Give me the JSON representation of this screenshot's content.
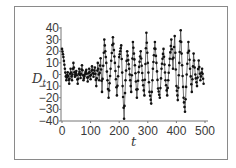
{
  "chart_data": {
    "type": "line",
    "title": "",
    "xlabel": "t",
    "ylabel": "D_t",
    "xlim": [
      0,
      500
    ],
    "ylim": [
      -40,
      40
    ],
    "xticks": [
      0,
      100,
      200,
      300,
      400,
      500
    ],
    "yticks": [
      40,
      30,
      20,
      10,
      0,
      -10,
      -20,
      -30,
      -40
    ],
    "grid": false,
    "legend": null,
    "marker": "filled-circle",
    "line_color": "#333333",
    "marker_color": "#111111",
    "keypoints": [
      [
        0,
        22
      ],
      [
        5,
        15
      ],
      [
        10,
        5
      ],
      [
        15,
        -5
      ],
      [
        20,
        2
      ],
      [
        25,
        -8
      ],
      [
        30,
        5
      ],
      [
        35,
        -5
      ],
      [
        40,
        10
      ],
      [
        45,
        -2
      ],
      [
        50,
        3
      ],
      [
        55,
        -8
      ],
      [
        60,
        5
      ],
      [
        65,
        -3
      ],
      [
        70,
        8
      ],
      [
        75,
        -5
      ],
      [
        80,
        0
      ],
      [
        85,
        4
      ],
      [
        90,
        -6
      ],
      [
        95,
        5
      ],
      [
        100,
        -4
      ],
      [
        105,
        7
      ],
      [
        110,
        -2
      ],
      [
        115,
        6
      ],
      [
        120,
        -10
      ],
      [
        125,
        10
      ],
      [
        130,
        -5
      ],
      [
        135,
        14
      ],
      [
        140,
        -15
      ],
      [
        148,
        30
      ],
      [
        155,
        10
      ],
      [
        163,
        -20
      ],
      [
        170,
        5
      ],
      [
        178,
        32
      ],
      [
        185,
        10
      ],
      [
        192,
        -18
      ],
      [
        200,
        15
      ],
      [
        207,
        25
      ],
      [
        212,
        -10
      ],
      [
        217,
        -38
      ],
      [
        222,
        -5
      ],
      [
        228,
        20
      ],
      [
        235,
        5
      ],
      [
        242,
        -15
      ],
      [
        248,
        28
      ],
      [
        255,
        8
      ],
      [
        262,
        -20
      ],
      [
        268,
        2
      ],
      [
        275,
        20
      ],
      [
        282,
        -5
      ],
      [
        288,
        -18
      ],
      [
        295,
        36
      ],
      [
        300,
        10
      ],
      [
        306,
        -15
      ],
      [
        312,
        -25
      ],
      [
        318,
        5
      ],
      [
        325,
        28
      ],
      [
        330,
        10
      ],
      [
        336,
        -12
      ],
      [
        342,
        -20
      ],
      [
        348,
        5
      ],
      [
        355,
        22
      ],
      [
        362,
        -5
      ],
      [
        368,
        -18
      ],
      [
        375,
        8
      ],
      [
        382,
        30
      ],
      [
        388,
        5
      ],
      [
        394,
        33
      ],
      [
        400,
        -10
      ],
      [
        405,
        -22
      ],
      [
        410,
        10
      ],
      [
        415,
        38
      ],
      [
        420,
        8
      ],
      [
        425,
        -20
      ],
      [
        430,
        -32
      ],
      [
        436,
        0
      ],
      [
        442,
        28
      ],
      [
        448,
        5
      ],
      [
        454,
        -15
      ],
      [
        460,
        18
      ],
      [
        466,
        0
      ],
      [
        472,
        -10
      ],
      [
        478,
        12
      ],
      [
        484,
        -5
      ],
      [
        490,
        5
      ],
      [
        495,
        -8
      ]
    ]
  },
  "axes": {
    "y_tick_labels": [
      "40",
      "30",
      "20",
      "10",
      "0",
      "−10",
      "−20",
      "−30",
      "−40"
    ],
    "x_tick_labels": [
      "0",
      "100",
      "200",
      "300",
      "400",
      "500"
    ],
    "ylabel_main": "D",
    "ylabel_sub": "t",
    "xlabel": "t"
  }
}
